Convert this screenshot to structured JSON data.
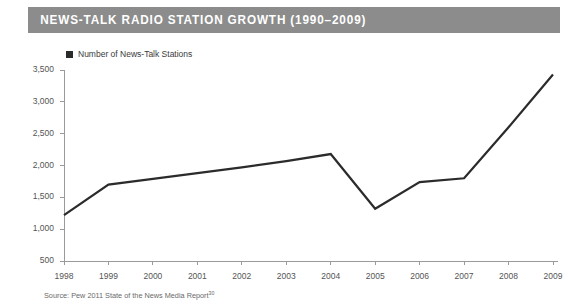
{
  "header": {
    "title": "NEWS-TALK RADIO STATION GROWTH (1990–2009)",
    "bar_color": "#8c8c8c",
    "text_color": "#ffffff"
  },
  "legend": {
    "position": "top-left",
    "swatch_icon": "square-marker-icon",
    "entries": [
      {
        "label": "Number of News-Talk Stations",
        "color": "#2b2b2b"
      }
    ]
  },
  "source": {
    "text": "Source: Pew 2011 State of the News Media Report",
    "superscript": "30"
  },
  "chart_data": {
    "type": "line",
    "title": "NEWS-TALK RADIO STATION GROWTH (1990–2009)",
    "xlabel": "",
    "ylabel": "",
    "categories": [
      "1998",
      "1999",
      "2000",
      "2001",
      "2002",
      "2003",
      "2004",
      "2005",
      "2006",
      "2007",
      "2008",
      "2009"
    ],
    "series": [
      {
        "name": "Number of News-Talk Stations",
        "color": "#2b2b2b",
        "values": [
          1220,
          1700,
          1790,
          1880,
          1970,
          2070,
          2180,
          1320,
          1740,
          1800,
          2600,
          3430
        ]
      }
    ],
    "ylim": [
      500,
      3500
    ],
    "yticks": [
      500,
      1000,
      1500,
      2000,
      2500,
      3000,
      3500
    ],
    "ytick_labels": [
      "500",
      "1,000",
      "1,500",
      "2,000",
      "2,500",
      "3,000",
      "3,500"
    ],
    "grid": false,
    "legend_position": "top-left",
    "line_width": 2.2
  }
}
